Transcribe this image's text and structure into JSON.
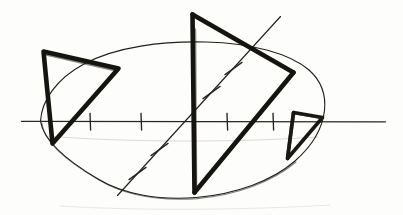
{
  "figure": {
    "canvas": {
      "width": 403,
      "height": 215
    },
    "ink_color": "#16140f",
    "paper_color": "#fdfdfc",
    "faint_color": "#8d8a84"
  },
  "shapes": {
    "oval": {
      "name": "outer-oval",
      "stroke": "thin",
      "path": "M 40.5 121.5 C 41.5 101 56 79 84 64 C 116 46.5 163 41 206 42 C 252 43 290 53.5 309 70 C 322.5 82 326 96 324.5 110.5 C 322.5 128 312 146 295 161 C 272 181 236 194 196 197.5 C 158 200.5 123 194 98 179 C 65 159.5 44 141 40.5 121.5 Z"
    },
    "axis": {
      "name": "horizontal-axis",
      "stroke": "axis",
      "x1": 21.5,
      "y1": 121.3,
      "x2": 385.5,
      "y2": 121.8,
      "ticks_x": [
        90,
        141,
        227,
        273
      ],
      "tick_half_height": 8
    },
    "diagonal": {
      "name": "diagonal-axis",
      "stroke": "thin",
      "x1": 117.5,
      "y1": 195.5,
      "x2": 280.5,
      "y2": 16.5,
      "ticks": [
        {
          "cx": 137.5,
          "cy": 173.5
        },
        {
          "cx": 159.5,
          "cy": 149.5
        },
        {
          "cx": 211.5,
          "cy": 92.5
        },
        {
          "cx": 233.5,
          "cy": 68.5
        }
      ],
      "tick_half_length": 8.5
    },
    "left_triangle": {
      "name": "left-triangle",
      "stroke": "thick",
      "vertices": [
        {
          "x": 43.5,
          "y": 51.5
        },
        {
          "x": 118.5,
          "y": 68.5
        },
        {
          "x": 52.5,
          "y": 143.5
        }
      ]
    },
    "middle_triangle": {
      "name": "middle-triangle",
      "stroke": "thick",
      "vertices": [
        {
          "x": 192.5,
          "y": 14.5
        },
        {
          "x": 293.5,
          "y": 72.5
        },
        {
          "x": 194.5,
          "y": 192.5
        }
      ],
      "note": "vertical left edge runs the full height of the figure"
    },
    "lower_diagonal": {
      "name": "lower-right-diagonal",
      "stroke": "thick",
      "x1": 194.5,
      "y1": 192.5,
      "x2": 293.5,
      "y2": 72.5
    },
    "quadrilateral": {
      "name": "small-quadrilateral",
      "stroke": "thick2",
      "vertices": [
        {
          "x": 293.5,
          "y": 112.5
        },
        {
          "x": 322.5,
          "y": 117.5
        },
        {
          "x": 287.5,
          "y": 158.5
        }
      ],
      "closing_edge": true
    }
  },
  "labels": {
    "none_visible": ""
  }
}
